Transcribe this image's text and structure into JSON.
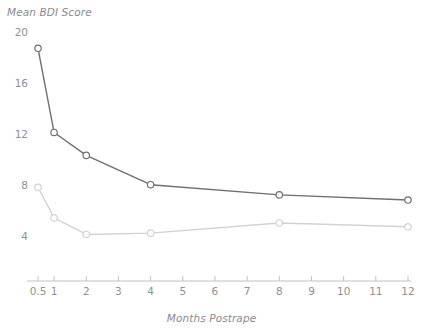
{
  "chart_data": {
    "type": "line",
    "title": "",
    "xlabel": "Months Postrape",
    "ylabel": "Mean BDI Score",
    "x": [
      0.5,
      1,
      2,
      4,
      8,
      12
    ],
    "xtick_labels": [
      "0.5",
      "1",
      "2",
      "3",
      "4",
      "5",
      "6",
      "7",
      "8",
      "9",
      "10",
      "11",
      "12"
    ],
    "xtick_values": [
      0.5,
      1,
      2,
      3,
      4,
      5,
      6,
      7,
      8,
      9,
      10,
      11,
      12
    ],
    "ytick_labels": [
      "20",
      "16",
      "12",
      "8",
      "4"
    ],
    "ytick_values": [
      20,
      16,
      12,
      8,
      4
    ],
    "xlim": [
      0.5,
      12
    ],
    "ylim": [
      2.4,
      20.4
    ],
    "grid": false,
    "legend": "none",
    "marker": "open-circle",
    "series": [
      {
        "name": "rape-victims",
        "color": "#6e6e73",
        "values": [
          18.8,
          12.2,
          10.4,
          8.1,
          7.3,
          6.9
        ]
      },
      {
        "name": "non-victim-controls",
        "color": "#d2d2d6",
        "values": [
          7.9,
          5.5,
          4.2,
          4.3,
          5.1,
          4.8
        ]
      }
    ]
  },
  "axis_style": {
    "axis_line_color": "#c2c2c6",
    "tick_color": "#c2c2c6",
    "label_color": "#8f8f95"
  }
}
